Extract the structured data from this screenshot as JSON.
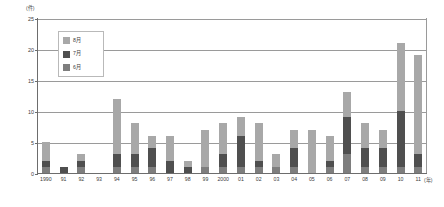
{
  "chart_data": {
    "type": "bar",
    "title": "",
    "subtitle": "",
    "xlabel": "(年)",
    "ylabel": "(件)",
    "ylim": [
      0,
      25
    ],
    "yticks": [
      0,
      5,
      10,
      15,
      20,
      25
    ],
    "grid": true,
    "stacked": true,
    "legend_position": "inside-top-left",
    "categories": [
      "1990",
      "91",
      "92",
      "93",
      "94",
      "95",
      "96",
      "97",
      "98",
      "99",
      "2000",
      "01",
      "02",
      "03",
      "04",
      "05",
      "06",
      "07",
      "08",
      "09",
      "10",
      "11"
    ],
    "series": [
      {
        "name": "6月",
        "color": "#7e7e7e",
        "values": [
          1,
          0,
          1,
          0,
          1,
          1,
          1,
          0,
          0,
          1,
          1,
          1,
          1,
          1,
          1,
          0,
          1,
          3,
          1,
          1,
          1,
          1
        ]
      },
      {
        "name": "7月",
        "color": "#4f4f4f",
        "values": [
          1,
          1,
          1,
          0,
          2,
          2,
          3,
          2,
          1,
          0,
          2,
          5,
          1,
          0,
          3,
          0,
          1,
          6,
          3,
          3,
          9,
          2
        ]
      },
      {
        "name": "8月",
        "color": "#a8a8a8",
        "values": [
          3,
          0,
          1,
          0,
          9,
          5,
          2,
          4,
          1,
          6,
          5,
          3,
          6,
          2,
          3,
          7,
          4,
          4,
          4,
          3,
          11,
          16
        ]
      }
    ],
    "totals": [
      5,
      1,
      3,
      0,
      12,
      8,
      6,
      6,
      2,
      7,
      8,
      9,
      8,
      3,
      7,
      7,
      6,
      13,
      8,
      7,
      21,
      19
    ]
  },
  "legend": {
    "items": [
      {
        "label": "8月"
      },
      {
        "label": "7月"
      },
      {
        "label": "6月"
      }
    ]
  }
}
